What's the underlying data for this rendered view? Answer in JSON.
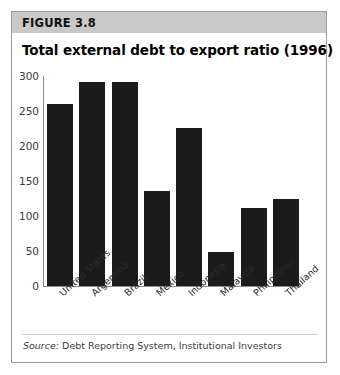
{
  "figure": {
    "label": "FIGURE 3.8",
    "title": "Total external debt to export ratio (1996)",
    "source_prefix": "Source:",
    "source_text": "Debt Reporting System, Institutional Investors"
  },
  "colors": {
    "band": "#c9c9c9",
    "bar": "#1b1b1b",
    "frame": "#9a9a9a",
    "axis": "#8d8d8d"
  },
  "chart_data": {
    "type": "bar",
    "title": "Total external debt to export ratio (1996)",
    "xlabel": "",
    "ylabel": "",
    "ylim": [
      0,
      300
    ],
    "yticks": [
      0,
      50,
      100,
      150,
      200,
      250,
      300
    ],
    "grid": false,
    "legend": null,
    "categories": [
      "United States",
      "Argentina",
      "Brazil",
      "Mexico",
      "Indonesia",
      "Malaysia",
      "Philippines",
      "Thailand"
    ],
    "values": [
      260,
      291,
      291,
      136,
      226,
      48,
      111,
      125
    ]
  }
}
